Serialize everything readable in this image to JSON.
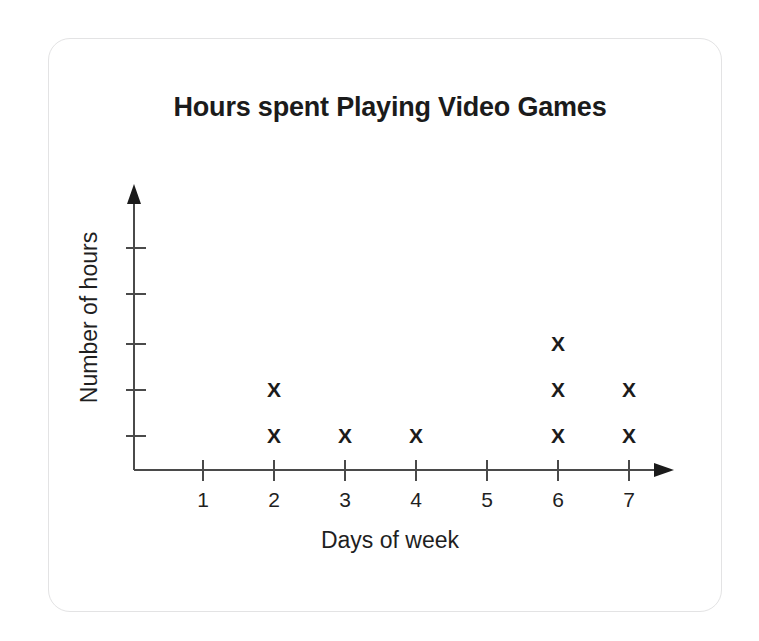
{
  "card": {
    "border_color": "#e3e3e4",
    "background": "#ffffff"
  },
  "chart_data": {
    "type": "scatter",
    "plot_style": "dot-plot",
    "title": "Hours spent Playing Video Games",
    "xlabel": "Days of week",
    "ylabel": "Number of hours",
    "marker_glyph": "X",
    "marker_color": "#1b1b1b",
    "axis_color": "#4a4a4a",
    "grid": false,
    "legend": null,
    "x_tick_labels": [
      "1",
      "2",
      "3",
      "4",
      "5",
      "6",
      "7"
    ],
    "x": [
      1,
      2,
      3,
      4,
      5,
      6,
      7
    ],
    "xlim": [
      0,
      7.6
    ],
    "y_tick_labels": [
      "",
      "",
      "",
      "",
      ""
    ],
    "y_tick_count": 5,
    "ylim": [
      0,
      5.5
    ],
    "x_axis_has_arrow": true,
    "y_axis_has_arrow": true,
    "categories": [
      "1",
      "2",
      "3",
      "4",
      "5",
      "6",
      "7"
    ],
    "values": [
      0,
      2,
      1,
      1,
      0,
      3,
      2
    ],
    "points": [
      {
        "x": 2,
        "y": 1
      },
      {
        "x": 2,
        "y": 2
      },
      {
        "x": 3,
        "y": 1
      },
      {
        "x": 4,
        "y": 1
      },
      {
        "x": 6,
        "y": 1
      },
      {
        "x": 6,
        "y": 2
      },
      {
        "x": 6,
        "y": 3
      },
      {
        "x": 7,
        "y": 1
      },
      {
        "x": 7,
        "y": 2
      }
    ]
  }
}
